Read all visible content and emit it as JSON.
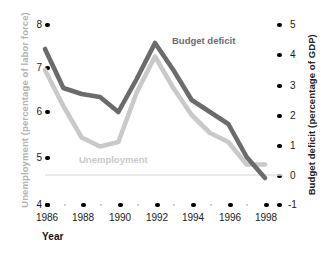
{
  "chart_data": {
    "type": "line",
    "title": "",
    "xlabel": "Year",
    "x": [
      1986,
      1987,
      1988,
      1989,
      1990,
      1991,
      1992,
      1993,
      1994,
      1995,
      1996,
      1997,
      1998
    ],
    "xticks": [
      "1986",
      "1988",
      "1990",
      "1992",
      "1994",
      "1996",
      "1998"
    ],
    "grid": false,
    "legend_position": "inline-annotations",
    "axes": [
      {
        "side": "left",
        "label": "Unemployment (percentage of labor force)",
        "ticks": [
          "8",
          "7",
          "6",
          "5",
          "4"
        ],
        "tick_values": [
          8,
          7,
          6,
          5,
          4
        ],
        "lim": [
          4,
          8
        ],
        "color": "#b3b3b3"
      },
      {
        "side": "right",
        "label": "Budget deficit (percentage of GDP)",
        "ticks": [
          "5",
          "4",
          "3",
          "2",
          "1",
          "0",
          "-1"
        ],
        "tick_values": [
          5,
          4,
          3,
          2,
          1,
          0,
          -1
        ],
        "lim": [
          -1,
          5
        ],
        "color": "#222222"
      }
    ],
    "series": [
      {
        "name": "Budget deficit",
        "axis": "right",
        "unit": "percentage of GDP",
        "color": "#6b6b6b",
        "values": [
          4.2,
          2.9,
          2.7,
          2.6,
          2.1,
          3.2,
          4.4,
          3.5,
          2.5,
          2.1,
          1.7,
          0.6,
          -0.1
        ]
      },
      {
        "name": "Unemployment",
        "axis": "left",
        "unit": "percentage of labor force",
        "color": "#c9c9c9",
        "values": [
          7.0,
          6.2,
          5.5,
          5.3,
          5.4,
          6.5,
          7.3,
          6.6,
          6.0,
          5.6,
          5.4,
          4.9,
          4.9
        ]
      }
    ],
    "annotations": [
      {
        "text": "Budget deficit",
        "series": "Budget deficit"
      },
      {
        "text": "Unemployment",
        "series": "Unemployment"
      }
    ],
    "reference_lines": [
      {
        "axis": "right",
        "value": 0,
        "color": "#e3e3e3"
      }
    ]
  },
  "colors": {
    "deficit": "#6b6b6b",
    "unemployment": "#c9c9c9",
    "left_axis_title": "#b3b3b3",
    "right_axis_title": "#222222",
    "tick": "#1a1a1a",
    "zero_line": "#e3e3e3",
    "background": "#ffffff"
  }
}
